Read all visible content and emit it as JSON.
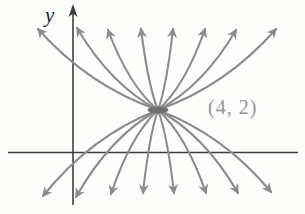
{
  "figure": {
    "y_axis_label": "y",
    "point_label": "(4, 2)",
    "colors": {
      "curve": "#8c8c8c",
      "axis": "#3e3e3e",
      "point_label": "#949494",
      "center_node": "#6f6f6f",
      "background": "#fdfdfb"
    },
    "center": {
      "x": 158,
      "y": 110
    },
    "x_axis": {
      "x1": 8,
      "x2": 298,
      "y": 152.5
    },
    "y_axis": {
      "x": 73,
      "y1": 11,
      "y2": 205
    },
    "top_arrow_tips": [
      [
        38,
        29
      ],
      [
        77,
        28
      ],
      [
        108,
        30
      ],
      [
        141,
        29
      ],
      [
        173,
        29
      ],
      [
        205,
        29
      ],
      [
        236,
        30
      ],
      [
        276,
        29
      ]
    ],
    "bottom_arrow_tips": [
      [
        43,
        196
      ],
      [
        76,
        197
      ],
      [
        111,
        194
      ],
      [
        143,
        193
      ],
      [
        174,
        193
      ],
      [
        206,
        193
      ],
      [
        238,
        193
      ],
      [
        271,
        192
      ]
    ],
    "curve_count": 8,
    "labeled_point_math": {
      "x": 4,
      "y": 2
    }
  }
}
